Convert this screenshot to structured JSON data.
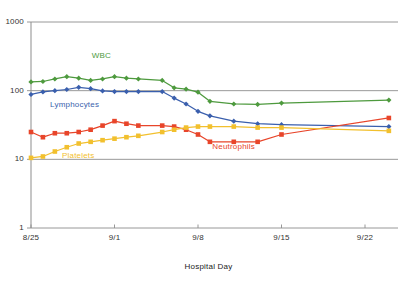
{
  "chart_data": {
    "type": "line",
    "title": "",
    "xlabel": "Hospital Day",
    "ylabel": "",
    "yscale": "log",
    "ylim": [
      1,
      1000
    ],
    "ytick_labels": [
      "1000",
      "100",
      "10",
      "1"
    ],
    "ytick_values": [
      1000,
      100,
      10,
      1
    ],
    "xtick_labels": [
      "8/25",
      "9/1",
      "9/8",
      "9/15",
      "9/22"
    ],
    "xtick_days": [
      0,
      7,
      14,
      21,
      28
    ],
    "grid": "horizontal",
    "legend_position": "inline-labels",
    "series": [
      {
        "name": "WBC",
        "color": "#4e9a3e",
        "marker": "diamond",
        "label_x_day": 5.1,
        "label_y_value": 320,
        "x": [
          0,
          1,
          2,
          3,
          4,
          5,
          6,
          7,
          8,
          9,
          11,
          12,
          13,
          14,
          15,
          17,
          19,
          21,
          30
        ],
        "y": [
          134,
          136,
          148,
          160,
          152,
          141,
          148,
          160,
          152,
          148,
          141,
          110,
          105,
          95,
          70,
          64,
          63,
          66,
          73
        ]
      },
      {
        "name": "Lymphocytes",
        "color": "#3a5fad",
        "marker": "diamond",
        "label_x_day": 1.6,
        "label_y_value": 62,
        "x": [
          0,
          1,
          2,
          3,
          4,
          5,
          6,
          7,
          8,
          9,
          11,
          12,
          13,
          14,
          15,
          17,
          19,
          21,
          30
        ],
        "y": [
          88,
          96,
          100,
          104,
          112,
          107,
          99,
          97,
          97,
          97,
          97,
          78,
          64,
          50,
          43,
          36,
          33,
          32,
          30
        ]
      },
      {
        "name": "Neutrophils",
        "color": "#e8452a",
        "marker": "square",
        "label_x_day": 15.2,
        "label_y_value": 15,
        "x": [
          0,
          1,
          2,
          3,
          4,
          5,
          6,
          7,
          8,
          9,
          11,
          12,
          13,
          14,
          15,
          17,
          19,
          21,
          30
        ],
        "y": [
          25,
          21,
          24,
          24,
          25,
          27,
          31,
          36,
          33,
          31,
          31,
          30,
          27,
          23,
          18,
          18,
          18,
          23,
          40
        ]
      },
      {
        "name": "Platelets",
        "color": "#f2c02e",
        "marker": "square",
        "label_x_day": 2.6,
        "label_y_value": 11.3,
        "x": [
          0,
          1,
          2,
          3,
          4,
          5,
          6,
          7,
          8,
          9,
          11,
          12,
          13,
          14,
          15,
          17,
          19,
          21,
          30
        ],
        "y": [
          10.5,
          11,
          13,
          15,
          17,
          18,
          19,
          20,
          21,
          22,
          25,
          27,
          29,
          30,
          30,
          30,
          29,
          29,
          26
        ]
      }
    ]
  },
  "axes": {
    "x_title": "Hospital Day"
  },
  "caption": {
    "cut_off_text": ""
  }
}
